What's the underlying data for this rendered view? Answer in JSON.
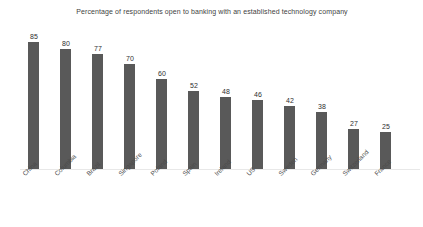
{
  "chart_data": {
    "type": "bar",
    "title": "Percentage of respondents open to banking with an established technology company",
    "xlabel": "",
    "ylabel": "",
    "ylim": [
      0,
      85
    ],
    "grid": false,
    "legend": false,
    "bar_color": "#595959",
    "categories": [
      "China",
      "Columbia",
      "Brazil",
      "Singapore",
      "Poland",
      "Spain",
      "Ireland",
      "US",
      "Sweden",
      "Germany",
      "Switzerland",
      "France"
    ],
    "values": [
      85,
      80,
      77,
      70,
      60,
      52,
      48,
      46,
      42,
      38,
      27,
      25
    ],
    "data_labels": [
      "85",
      "80",
      "77",
      "70",
      "60",
      "52",
      "48",
      "46",
      "42",
      "38",
      "27",
      "25"
    ]
  }
}
